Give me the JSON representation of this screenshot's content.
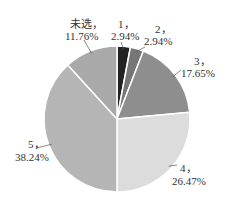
{
  "chart_data": {
    "type": "pie",
    "title": "",
    "start": "top",
    "direction": "clockwise",
    "slices": [
      {
        "name": "1",
        "value": 2.94,
        "label": "1，",
        "pct": "2.94%",
        "color": "#222222"
      },
      {
        "name": "2",
        "value": 2.94,
        "label": "2，",
        "pct": "2.94%",
        "color": "#767676"
      },
      {
        "name": "3",
        "value": 17.65,
        "label": "3，",
        "pct": "17.65%",
        "color": "#8e8e8e"
      },
      {
        "name": "4",
        "value": 26.47,
        "label": "4，",
        "pct": "26.47%",
        "color": "#dcdcdc"
      },
      {
        "name": "5",
        "value": 38.24,
        "label": "5，",
        "pct": "38.24%",
        "color": "#b5b5b5"
      },
      {
        "name": "未选",
        "value": 11.76,
        "label": "未选，",
        "pct": "11.76%",
        "color": "#a9a9a9"
      }
    ],
    "separator_color": "#ffffff"
  }
}
